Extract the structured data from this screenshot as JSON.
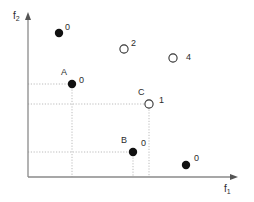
{
  "figure": {
    "background_color": "#ffffff",
    "axis_color": "#8a8a8a",
    "guide_color": "#b4b4b4",
    "marker_fill_color": "#111111",
    "marker_open_fill": "#ffffff",
    "marker_stroke_color": "#333333",
    "text_color": "#2b2b2b"
  },
  "axes": {
    "x_label": "f",
    "x_label_sub": "1",
    "y_label": "f",
    "y_label_sub": "2",
    "origin_px": {
      "x": 28,
      "y": 177
    },
    "x_axis_end_px": 238,
    "y_axis_end_px": 13
  },
  "chart_data": {
    "type": "scatter",
    "title": "",
    "xlabel": "f1",
    "ylabel": "f2",
    "grid": false,
    "legend": "none",
    "marker_styles": [
      "filled",
      "open"
    ],
    "points": [
      {
        "name": "",
        "label": "0",
        "style": "filled",
        "px": {
          "x": 59,
          "y": 33
        },
        "label_px": {
          "x": 65,
          "y": 23
        },
        "guides": []
      },
      {
        "name": "",
        "label": "2",
        "style": "open",
        "px": {
          "x": 124,
          "y": 49
        },
        "label_px": {
          "x": 131,
          "y": 39
        },
        "guides": []
      },
      {
        "name": "",
        "label": "4",
        "style": "open",
        "px": {
          "x": 173,
          "y": 58
        },
        "label_px": {
          "x": 186,
          "y": 53
        },
        "guides": []
      },
      {
        "name": "A",
        "label": "0",
        "style": "filled",
        "px": {
          "x": 72,
          "y": 84
        },
        "label_px": {
          "x": 79,
          "y": 76
        },
        "name_px": {
          "x": 61,
          "y": 68
        },
        "guides": [
          "h",
          "v"
        ]
      },
      {
        "name": "C",
        "label": "1",
        "style": "open",
        "px": {
          "x": 149,
          "y": 104
        },
        "label_px": {
          "x": 159,
          "y": 96
        },
        "name_px": {
          "x": 138,
          "y": 88
        },
        "guides": [
          "h",
          "v"
        ]
      },
      {
        "name": "B",
        "label": "0",
        "style": "filled",
        "px": {
          "x": 133,
          "y": 152
        },
        "label_px": {
          "x": 141,
          "y": 139
        },
        "name_px": {
          "x": 121,
          "y": 136
        },
        "guides": [
          "h",
          "v"
        ]
      },
      {
        "name": "",
        "label": "0",
        "style": "filled",
        "px": {
          "x": 186,
          "y": 165
        },
        "label_px": {
          "x": 194,
          "y": 154
        },
        "guides": []
      }
    ]
  }
}
